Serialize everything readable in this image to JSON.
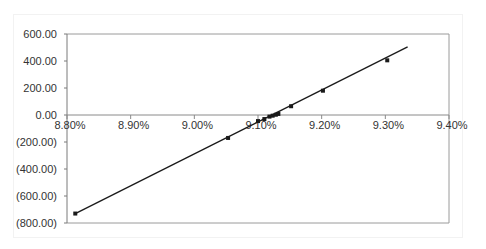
{
  "chart_data": {
    "type": "scatter",
    "title": "",
    "xlabel": "",
    "ylabel": "",
    "x_tick_labels": [
      "8.80%",
      "8.90%",
      "9.00%",
      "9.10%",
      "9.20%",
      "9.30%",
      "9.40%"
    ],
    "x_ticks": [
      8.8,
      8.9,
      9.0,
      9.1,
      9.2,
      9.3,
      9.4
    ],
    "y_tick_labels": [
      "600.00",
      "400.00",
      "200.00",
      "0.00",
      "(200.00)",
      "(400.00)",
      "(600.00)",
      "(800.00)"
    ],
    "y_ticks": [
      600,
      400,
      200,
      0,
      -200,
      -400,
      -600,
      -800
    ],
    "xlim": [
      8.8,
      9.4
    ],
    "ylim": [
      -800,
      600
    ],
    "grid": false,
    "legend": null,
    "series": [
      {
        "name": "data",
        "marker": "square",
        "color": "#1a1a1a",
        "points": [
          {
            "x": 8.813,
            "y": -730
          },
          {
            "x": 9.053,
            "y": -170
          },
          {
            "x": 9.1,
            "y": -45
          },
          {
            "x": 9.11,
            "y": -30
          },
          {
            "x": 9.118,
            "y": -12
          },
          {
            "x": 9.123,
            "y": -5
          },
          {
            "x": 9.128,
            "y": 2
          },
          {
            "x": 9.132,
            "y": 8
          },
          {
            "x": 9.152,
            "y": 65
          },
          {
            "x": 9.202,
            "y": 180
          },
          {
            "x": 9.303,
            "y": 405
          }
        ]
      }
    ],
    "trendline": {
      "type": "linear",
      "color": "#1a1a1a",
      "from": {
        "x": 8.813,
        "y": -730
      },
      "to": {
        "x": 9.335,
        "y": 505
      }
    }
  }
}
